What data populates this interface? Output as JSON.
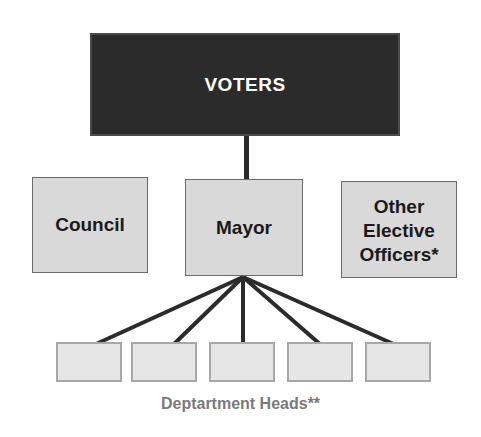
{
  "diagram": {
    "type": "org-chart",
    "top_node": {
      "label": "VOTERS",
      "fill": "#2b2b2b",
      "text_color": "#ffffff"
    },
    "middle_nodes": [
      {
        "id": "council",
        "label": "Council"
      },
      {
        "id": "mayor",
        "label": "Mayor"
      },
      {
        "id": "other",
        "label": "Other Elective Officers*"
      }
    ],
    "department_boxes": [
      {
        "id": "dept-1",
        "label": ""
      },
      {
        "id": "dept-2",
        "label": ""
      },
      {
        "id": "dept-3",
        "label": ""
      },
      {
        "id": "dept-4",
        "label": ""
      },
      {
        "id": "dept-5",
        "label": ""
      }
    ],
    "department_caption": "Deptartment Heads**",
    "edges": [
      {
        "from": "VOTERS",
        "to": "Mayor"
      },
      {
        "from": "Mayor",
        "to": "dept-1"
      },
      {
        "from": "Mayor",
        "to": "dept-2"
      },
      {
        "from": "Mayor",
        "to": "dept-3"
      },
      {
        "from": "Mayor",
        "to": "dept-4"
      },
      {
        "from": "Mayor",
        "to": "dept-5"
      }
    ],
    "colors": {
      "node_fill": "#d9d9d9",
      "dept_fill": "#e6e6e6",
      "line": "#2b2b2b",
      "caption": "#7a7a7a"
    }
  }
}
